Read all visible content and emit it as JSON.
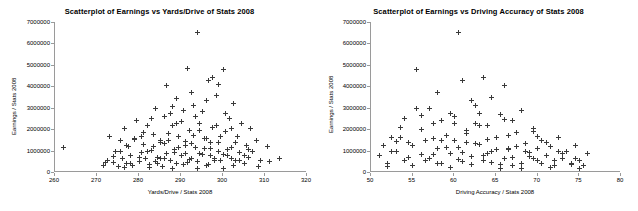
{
  "chart_data": [
    {
      "type": "scatter",
      "title": "Scatterplot of Earnings vs Yards/Drive of Stats 2008",
      "xlabel": "Yards/Drive / Stats 2008",
      "ylabel": "Earnings / Stats 2008",
      "xlim": [
        260,
        320
      ],
      "ylim": [
        0,
        7000000
      ],
      "xticks": [
        260,
        270,
        280,
        290,
        300,
        310,
        320
      ],
      "yticks": [
        0,
        1000000,
        2000000,
        3000000,
        4000000,
        5000000,
        6000000,
        7000000
      ],
      "ytick_labels": [
        "0",
        "1000000",
        "2000000",
        "3000000",
        "4000000",
        "5000000",
        "6000000",
        "7000000"
      ],
      "grid": false,
      "legend": false,
      "marker": "plus",
      "marker_color": "#3a3a3a",
      "points": [
        [
          262.0,
          1150000
        ],
        [
          271.5,
          320000
        ],
        [
          272.5,
          560000
        ],
        [
          273.0,
          1650000
        ],
        [
          274.0,
          430000
        ],
        [
          274.5,
          980000
        ],
        [
          275.0,
          260000
        ],
        [
          275.5,
          1450000
        ],
        [
          276.0,
          640000
        ],
        [
          276.5,
          2050000
        ],
        [
          277.0,
          420000
        ],
        [
          277.5,
          1180000
        ],
        [
          278.0,
          760000
        ],
        [
          278.5,
          300000
        ],
        [
          279.0,
          1580000
        ],
        [
          279.5,
          2420000
        ],
        [
          280.0,
          500000
        ],
        [
          280.5,
          900000
        ],
        [
          281.0,
          1300000
        ],
        [
          281.5,
          620000
        ],
        [
          282.0,
          2150000
        ],
        [
          282.5,
          340000
        ],
        [
          283.0,
          1020000
        ],
        [
          283.5,
          1760000
        ],
        [
          284.0,
          480000
        ],
        [
          284.5,
          700000
        ],
        [
          285.0,
          1380000
        ],
        [
          285.5,
          260000
        ],
        [
          286.0,
          2600000
        ],
        [
          286.5,
          880000
        ],
        [
          287.0,
          1480000
        ],
        [
          287.5,
          560000
        ],
        [
          288.0,
          2150000
        ],
        [
          288.5,
          1050000
        ],
        [
          289.0,
          380000
        ],
        [
          289.5,
          1680000
        ],
        [
          290.0,
          760000
        ],
        [
          290.5,
          2850000
        ],
        [
          291.0,
          1220000
        ],
        [
          291.5,
          440000
        ],
        [
          292.0,
          1920000
        ],
        [
          292.5,
          640000
        ],
        [
          293.0,
          3100000
        ],
        [
          293.5,
          1150000
        ],
        [
          294.0,
          480000
        ],
        [
          294.5,
          2250000
        ],
        [
          295.0,
          820000
        ],
        [
          295.5,
          1560000
        ],
        [
          296.0,
          300000
        ],
        [
          296.5,
          4250000
        ],
        [
          297.0,
          1080000
        ],
        [
          297.5,
          2080000
        ],
        [
          298.0,
          620000
        ],
        [
          298.5,
          3550000
        ],
        [
          299.0,
          1380000
        ],
        [
          299.5,
          520000
        ],
        [
          300.0,
          4780000
        ],
        [
          300.5,
          1900000
        ],
        [
          301.0,
          760000
        ],
        [
          301.5,
          2500000
        ],
        [
          302.0,
          1150000
        ],
        [
          302.5,
          3200000
        ],
        [
          303.0,
          560000
        ],
        [
          303.5,
          1650000
        ],
        [
          304.0,
          900000
        ],
        [
          304.5,
          2250000
        ],
        [
          305.0,
          420000
        ],
        [
          305.5,
          1250000
        ],
        [
          306.0,
          680000
        ],
        [
          306.5,
          2050000
        ],
        [
          307.0,
          980000
        ],
        [
          308.0,
          1450000
        ],
        [
          309.0,
          560000
        ],
        [
          310.5,
          1180000
        ],
        [
          311.0,
          480000
        ],
        [
          313.5,
          650000
        ],
        [
          294.0,
          6500000
        ],
        [
          291.5,
          4820000
        ],
        [
          297.5,
          4420000
        ],
        [
          299.0,
          4080000
        ],
        [
          286.5,
          4050000
        ],
        [
          292.5,
          3700000
        ],
        [
          289.0,
          3420000
        ],
        [
          296.0,
          3350000
        ],
        [
          284.0,
          2950000
        ],
        [
          288.0,
          3050000
        ],
        [
          295.0,
          2820000
        ],
        [
          300.5,
          2720000
        ],
        [
          283.0,
          2500000
        ],
        [
          290.0,
          2380000
        ],
        [
          298.5,
          2180000
        ],
        [
          302.0,
          2020000
        ],
        [
          281.0,
          1850000
        ],
        [
          287.0,
          1780000
        ],
        [
          293.0,
          1720000
        ],
        [
          299.5,
          1640000
        ],
        [
          279.0,
          1520000
        ],
        [
          285.0,
          1480000
        ],
        [
          291.0,
          1420000
        ],
        [
          297.0,
          1360000
        ],
        [
          277.0,
          1260000
        ],
        [
          283.5,
          1200000
        ],
        [
          289.5,
          1150000
        ],
        [
          295.5,
          1100000
        ],
        [
          301.0,
          1050000
        ],
        [
          275.5,
          980000
        ],
        [
          282.0,
          940000
        ],
        [
          288.5,
          900000
        ],
        [
          294.5,
          860000
        ],
        [
          300.0,
          820000
        ],
        [
          305.0,
          780000
        ],
        [
          274.0,
          720000
        ],
        [
          280.0,
          680000
        ],
        [
          286.0,
          640000
        ],
        [
          292.0,
          600000
        ],
        [
          298.0,
          560000
        ],
        [
          304.0,
          520000
        ],
        [
          272.0,
          460000
        ],
        [
          278.0,
          420000
        ],
        [
          284.5,
          390000
        ],
        [
          290.5,
          360000
        ],
        [
          296.5,
          330000
        ],
        [
          302.5,
          300000
        ],
        [
          308.5,
          270000
        ],
        [
          276.5,
          230000
        ],
        [
          282.5,
          200000
        ],
        [
          288.0,
          180000
        ],
        [
          294.0,
          160000
        ],
        [
          300.0,
          150000
        ],
        [
          286.0,
          1350000
        ],
        [
          292.5,
          1320000
        ],
        [
          297.0,
          760000
        ],
        [
          303.0,
          1380000
        ],
        [
          289.0,
          2250000
        ],
        [
          294.5,
          1950000
        ],
        [
          285.0,
          620000
        ],
        [
          291.0,
          880000
        ],
        [
          296.0,
          1580000
        ],
        [
          299.0,
          950000
        ],
        [
          293.5,
          2600000
        ],
        [
          287.5,
          2720000
        ],
        [
          280.5,
          1680000
        ],
        [
          302.0,
          640000
        ],
        [
          306.0,
          1050000
        ]
      ]
    },
    {
      "type": "scatter",
      "title": "Scatterplot of Earnings vs Driving Accuracy of Stats 2008",
      "xlabel": "Driving Accuracy / Stats 2008",
      "ylabel": "Earnings / Stats 2008",
      "xlim": [
        50,
        80
      ],
      "ylim": [
        0,
        7000000
      ],
      "xticks": [
        50,
        55,
        60,
        65,
        70,
        75,
        80
      ],
      "yticks": [
        0,
        1000000,
        2000000,
        3000000,
        4000000,
        5000000,
        6000000,
        7000000
      ],
      "ytick_labels": [
        "0",
        "1000000",
        "2000000",
        "3000000",
        "4000000",
        "5000000",
        "6000000",
        "7000000"
      ],
      "grid": false,
      "legend": false,
      "marker": "plus",
      "marker_color": "#3a3a3a",
      "points": [
        [
          51.0,
          780000
        ],
        [
          51.5,
          1250000
        ],
        [
          52.0,
          420000
        ],
        [
          52.5,
          1620000
        ],
        [
          53.0,
          940000
        ],
        [
          53.5,
          2100000
        ],
        [
          54.0,
          560000
        ],
        [
          54.5,
          1380000
        ],
        [
          55.0,
          300000
        ],
        [
          55.5,
          2950000
        ],
        [
          56.0,
          820000
        ],
        [
          56.5,
          1480000
        ],
        [
          57.0,
          620000
        ],
        [
          57.5,
          2250000
        ],
        [
          58.0,
          1080000
        ],
        [
          58.5,
          380000
        ],
        [
          59.0,
          1720000
        ],
        [
          59.5,
          880000
        ],
        [
          60.0,
          2580000
        ],
        [
          60.5,
          1150000
        ],
        [
          61.0,
          480000
        ],
        [
          61.5,
          1920000
        ],
        [
          62.0,
          740000
        ],
        [
          62.5,
          3100000
        ],
        [
          63.0,
          1280000
        ],
        [
          63.5,
          540000
        ],
        [
          64.0,
          2180000
        ],
        [
          64.5,
          960000
        ],
        [
          65.0,
          1620000
        ],
        [
          65.5,
          340000
        ],
        [
          66.0,
          2450000
        ],
        [
          66.5,
          1120000
        ],
        [
          67.0,
          680000
        ],
        [
          67.5,
          1850000
        ],
        [
          68.0,
          420000
        ],
        [
          68.5,
          1350000
        ],
        [
          69.0,
          900000
        ],
        [
          69.5,
          2050000
        ],
        [
          70.0,
          560000
        ],
        [
          70.5,
          1480000
        ],
        [
          71.0,
          780000
        ],
        [
          71.5,
          1180000
        ],
        [
          72.0,
          300000
        ],
        [
          72.5,
          1620000
        ],
        [
          73.0,
          640000
        ],
        [
          73.5,
          980000
        ],
        [
          74.0,
          420000
        ],
        [
          74.5,
          1250000
        ],
        [
          75.0,
          560000
        ],
        [
          75.5,
          320000
        ],
        [
          76.0,
          880000
        ],
        [
          60.5,
          6500000
        ],
        [
          55.5,
          4800000
        ],
        [
          63.5,
          4420000
        ],
        [
          61.0,
          4280000
        ],
        [
          66.0,
          4050000
        ],
        [
          58.0,
          3700000
        ],
        [
          64.5,
          3480000
        ],
        [
          62.0,
          3350000
        ],
        [
          57.0,
          2980000
        ],
        [
          68.0,
          2880000
        ],
        [
          59.5,
          2750000
        ],
        [
          65.5,
          2680000
        ],
        [
          54.0,
          2520000
        ],
        [
          67.0,
          2400000
        ],
        [
          60.0,
          2280000
        ],
        [
          63.0,
          2180000
        ],
        [
          56.0,
          1980000
        ],
        [
          69.5,
          1880000
        ],
        [
          61.5,
          1780000
        ],
        [
          66.5,
          1720000
        ],
        [
          53.5,
          1600000
        ],
        [
          64.0,
          1520000
        ],
        [
          58.5,
          1460000
        ],
        [
          71.0,
          1400000
        ],
        [
          62.5,
          1320000
        ],
        [
          55.0,
          1260000
        ],
        [
          67.5,
          1200000
        ],
        [
          59.0,
          1150000
        ],
        [
          70.0,
          1100000
        ],
        [
          65.0,
          1050000
        ],
        [
          52.5,
          980000
        ],
        [
          68.5,
          940000
        ],
        [
          61.0,
          900000
        ],
        [
          73.0,
          860000
        ],
        [
          57.5,
          820000
        ],
        [
          63.5,
          780000
        ],
        [
          69.0,
          720000
        ],
        [
          54.5,
          680000
        ],
        [
          66.0,
          640000
        ],
        [
          60.5,
          600000
        ],
        [
          72.0,
          560000
        ],
        [
          56.5,
          520000
        ],
        [
          64.5,
          460000
        ],
        [
          70.5,
          420000
        ],
        [
          58.0,
          390000
        ],
        [
          74.0,
          360000
        ],
        [
          62.0,
          330000
        ],
        [
          67.0,
          300000
        ],
        [
          52.0,
          270000
        ],
        [
          71.5,
          230000
        ],
        [
          59.5,
          200000
        ],
        [
          65.5,
          180000
        ],
        [
          75.0,
          160000
        ],
        [
          68.0,
          150000
        ],
        [
          61.5,
          1380000
        ],
        [
          56.0,
          2620000
        ],
        [
          63.0,
          2720000
        ],
        [
          69.5,
          650000
        ],
        [
          57.5,
          1580000
        ],
        [
          64.0,
          880000
        ],
        [
          60.0,
          1480000
        ],
        [
          66.5,
          1050000
        ],
        [
          72.5,
          950000
        ],
        [
          53.0,
          1420000
        ],
        [
          70.0,
          1680000
        ],
        [
          62.5,
          2250000
        ],
        [
          58.5,
          2400000
        ],
        [
          74.5,
          640000
        ]
      ]
    }
  ]
}
